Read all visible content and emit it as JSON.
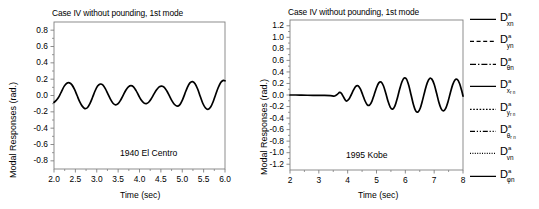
{
  "chart_data": [
    {
      "type": "line",
      "id": "el-centro",
      "title": "Case IV without pounding, 1st mode",
      "annotation": "1940 El Centro",
      "xlabel": "Time (sec)",
      "ylabel": "Modal Responses (rad.)",
      "xlim": [
        2.0,
        6.0
      ],
      "ylim": [
        -0.9,
        0.9
      ],
      "xticks": [
        "2.0",
        "2.5",
        "3.0",
        "3.5",
        "4.0",
        "4.5",
        "5.0",
        "5.5",
        "6.0"
      ],
      "xtick_values": [
        2.0,
        2.5,
        3.0,
        3.5,
        4.0,
        4.5,
        5.0,
        5.5,
        6.0
      ],
      "yticks": [
        "0.8",
        "0.6",
        "0.4",
        "0.2",
        "0.0",
        "-0.2",
        "-0.4",
        "-0.6",
        "-0.8"
      ],
      "ytick_values": [
        0.8,
        0.6,
        0.4,
        0.2,
        0.0,
        -0.2,
        -0.4,
        -0.6,
        -0.8
      ],
      "grid": false,
      "legend": "none",
      "series": [
        {
          "name": "D_xn",
          "x": [
            2.0,
            2.06,
            2.12,
            2.18,
            2.24,
            2.3,
            2.36,
            2.42,
            2.48,
            2.54,
            2.6,
            2.66,
            2.72,
            2.78,
            2.84,
            2.9,
            2.96,
            3.02,
            3.08,
            3.14,
            3.2,
            3.26,
            3.32,
            3.38,
            3.44,
            3.5,
            3.56,
            3.62,
            3.68,
            3.74,
            3.8,
            3.86,
            3.92,
            3.98,
            4.04,
            4.1,
            4.16,
            4.22,
            4.28,
            4.34,
            4.4,
            4.46,
            4.52,
            4.58,
            4.64,
            4.7,
            4.76,
            4.82,
            4.88,
            4.94,
            5.0,
            5.06,
            5.12,
            5.18,
            5.24,
            5.3,
            5.36,
            5.42,
            5.48,
            5.54,
            5.6,
            5.66,
            5.72,
            5.78,
            5.84,
            5.9,
            5.96,
            6.0
          ],
          "y": [
            -0.085,
            -0.055,
            -0.01,
            0.055,
            0.115,
            0.15,
            0.155,
            0.13,
            0.075,
            0.0,
            -0.075,
            -0.13,
            -0.16,
            -0.15,
            -0.1,
            -0.025,
            0.055,
            0.115,
            0.14,
            0.13,
            0.085,
            0.02,
            -0.045,
            -0.095,
            -0.115,
            -0.1,
            -0.055,
            0.005,
            0.065,
            0.105,
            0.12,
            0.105,
            0.06,
            0.0,
            -0.055,
            -0.09,
            -0.1,
            -0.08,
            -0.035,
            0.02,
            0.07,
            0.105,
            0.115,
            0.1,
            0.055,
            -0.005,
            -0.065,
            -0.11,
            -0.13,
            -0.115,
            -0.06,
            0.02,
            0.1,
            0.155,
            0.17,
            0.145,
            0.08,
            -0.01,
            -0.095,
            -0.15,
            -0.17,
            -0.145,
            -0.08,
            0.01,
            0.095,
            0.16,
            0.185,
            0.18
          ]
        }
      ]
    },
    {
      "type": "line",
      "id": "kobe",
      "title": "Case IV without pounding, 1st mode",
      "annotation": "1995 Kobe",
      "xlabel": "Time (sec)",
      "ylabel": "Modal Responses (rad.)",
      "xlim": [
        2.0,
        8.0
      ],
      "ylim": [
        -1.3,
        1.3
      ],
      "xticks": [
        "2",
        "3",
        "4",
        "5",
        "6",
        "7",
        "8"
      ],
      "xtick_values": [
        2,
        3,
        4,
        5,
        6,
        7,
        8
      ],
      "yticks": [
        "1.2",
        "1.0",
        "0.8",
        "0.6",
        "0.4",
        "0.2",
        "0.0",
        "-0.2",
        "-0.4",
        "-0.6",
        "-0.8",
        "-1.0",
        "-1.2"
      ],
      "ytick_values": [
        1.2,
        1.0,
        0.8,
        0.6,
        0.4,
        0.2,
        0.0,
        -0.2,
        -0.4,
        -0.6,
        -0.8,
        -1.0,
        -1.2
      ],
      "grid": false,
      "legend": "right",
      "series": [
        {
          "name": "D_xn",
          "x": [
            2.0,
            2.2,
            2.4,
            2.6,
            2.8,
            3.0,
            3.2,
            3.4,
            3.55,
            3.65,
            3.72,
            3.78,
            3.84,
            3.9,
            3.96,
            4.04,
            4.12,
            4.2,
            4.28,
            4.36,
            4.44,
            4.52,
            4.6,
            4.68,
            4.76,
            4.84,
            4.92,
            5.0,
            5.08,
            5.16,
            5.24,
            5.32,
            5.4,
            5.48,
            5.56,
            5.64,
            5.72,
            5.8,
            5.88,
            5.96,
            6.04,
            6.12,
            6.2,
            6.28,
            6.36,
            6.44,
            6.52,
            6.6,
            6.68,
            6.76,
            6.84,
            6.92,
            7.0,
            7.08,
            7.16,
            7.24,
            7.32,
            7.4,
            7.48,
            7.56,
            7.64,
            7.72,
            7.8,
            7.88,
            7.96,
            8.0
          ],
          "y": [
            0.0,
            0.0,
            -0.002,
            -0.004,
            -0.005,
            -0.006,
            -0.008,
            -0.012,
            -0.018,
            0.015,
            0.045,
            0.03,
            -0.02,
            -0.075,
            -0.105,
            -0.075,
            0.0,
            0.085,
            0.15,
            0.16,
            0.105,
            0.005,
            -0.1,
            -0.17,
            -0.175,
            -0.11,
            0.005,
            0.125,
            0.21,
            0.225,
            0.16,
            0.035,
            -0.11,
            -0.215,
            -0.245,
            -0.19,
            -0.06,
            0.095,
            0.225,
            0.295,
            0.275,
            0.165,
            0.0,
            -0.165,
            -0.275,
            -0.295,
            -0.225,
            -0.085,
            0.075,
            0.21,
            0.285,
            0.275,
            0.185,
            0.04,
            -0.12,
            -0.235,
            -0.275,
            -0.23,
            -0.115,
            0.035,
            0.175,
            0.26,
            0.27,
            0.2,
            0.065,
            -0.02
          ]
        }
      ]
    }
  ],
  "legend": {
    "entries": [
      {
        "style": "solid",
        "base": "D",
        "sup": "a",
        "sub": "xn",
        "subsub": ""
      },
      {
        "style": "dashed",
        "base": "D",
        "sup": "a",
        "sub": "yn",
        "subsub": ""
      },
      {
        "style": "dashdot",
        "base": "D",
        "sup": "a",
        "sub": "θn",
        "subsub": ""
      },
      {
        "style": "solid",
        "base": "D",
        "sup": "a",
        "sub": "x",
        "subsub": "r n"
      },
      {
        "style": "dotted",
        "base": "D",
        "sup": "a",
        "sub": "y",
        "subsub": "r n"
      },
      {
        "style": "dashdotdot",
        "base": "D",
        "sup": "a",
        "sub": "θ",
        "subsub": "r n"
      },
      {
        "style": "finedotted",
        "base": "D",
        "sup": "a",
        "sub": "vn",
        "subsub": ""
      },
      {
        "style": "solid",
        "base": "D",
        "sup": "a",
        "sub": "φn",
        "subsub": ""
      }
    ]
  },
  "colors": {
    "line": "#000000",
    "axis": "#808080",
    "text": "#000000",
    "background": "#ffffff"
  }
}
